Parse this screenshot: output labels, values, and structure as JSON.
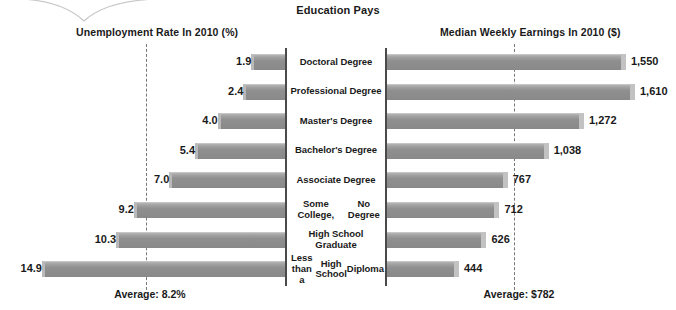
{
  "chart_data": {
    "type": "bar",
    "title": "Education Pays",
    "subtype": "butterfly-diverging",
    "categories": [
      "Doctoral Degree",
      "Professional Degree",
      "Master's Degree",
      "Bachelor's Degree",
      "Associate Degree",
      "Some College,\nNo Degree",
      "High School Graduate",
      "Less than a\nHigh School\nDiploma"
    ],
    "category_lines": [
      [
        "Doctoral Degree"
      ],
      [
        "Professional Degree"
      ],
      [
        "Master's Degree"
      ],
      [
        "Bachelor's Degree"
      ],
      [
        "Associate Degree"
      ],
      [
        "Some College,",
        "No Degree"
      ],
      [
        "High School Graduate"
      ],
      [
        "Less than a",
        "High School",
        "Diploma"
      ]
    ],
    "series": [
      {
        "name": "Unemployment Rate In 2010 (%)",
        "side": "left",
        "unit": "%",
        "values": [
          1.9,
          2.4,
          4.0,
          5.4,
          7.0,
          9.2,
          10.3,
          14.9
        ],
        "labels": [
          "1.9",
          "2.4",
          "4.0",
          "5.4",
          "7.0",
          "9.2",
          "10.3",
          "14.9"
        ],
        "max": 14.9,
        "average": 8.2,
        "average_label": "Average: 8.2%"
      },
      {
        "name": "Median Weekly Earnings In 2010 ($)",
        "side": "right",
        "unit": "$",
        "values": [
          1550,
          1610,
          1272,
          1038,
          767,
          712,
          626,
          444
        ],
        "labels": [
          "1,550",
          "1,610",
          "1,272",
          "1,038",
          "767",
          "712",
          "626",
          "444"
        ],
        "max": 1610,
        "average": 782,
        "average_label": "Average: $782"
      }
    ],
    "grid": false,
    "legend": "none",
    "colors": {
      "bar": "#8f8f8f",
      "bar_highlight": "#c2c2c2",
      "axis": "#4a4a4a",
      "average_line": "#777777",
      "text": "#1a1a1a",
      "background": "#ffffff"
    }
  },
  "header": {
    "title": "Education Pays",
    "left_panel_title": "Unemployment Rate In 2010 (%)",
    "right_panel_title": "Median Weekly Earnings In 2010 ($)"
  },
  "footer": {
    "left_average": "Average: 8.2%",
    "right_average": "Average: $782"
  }
}
